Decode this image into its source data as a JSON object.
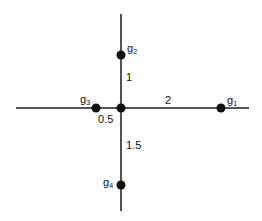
{
  "diagram": {
    "type": "star-graph",
    "center": {
      "x": 121,
      "y": 108
    },
    "edges": [
      {
        "id": "horizontal-axis",
        "x1": 16,
        "y1": 108,
        "x2": 249,
        "y2": 108
      },
      {
        "id": "vertical-axis",
        "x1": 121,
        "y1": 14,
        "x2": 121,
        "y2": 211
      }
    ],
    "nodes": [
      {
        "id": "center",
        "x": 121,
        "y": 108,
        "label": "",
        "sub": ""
      },
      {
        "id": "g1",
        "x": 221,
        "y": 108,
        "label": "g",
        "sub": "1",
        "lx": 227,
        "ly": 104
      },
      {
        "id": "g2",
        "x": 121,
        "y": 55,
        "label": "g",
        "sub": "2",
        "lx": 127,
        "ly": 52
      },
      {
        "id": "g3",
        "x": 96,
        "y": 108,
        "label": "g",
        "sub": "3",
        "lx": 80,
        "ly": 103
      },
      {
        "id": "g4",
        "x": 121,
        "y": 185,
        "label": "g",
        "sub": "4",
        "lx": 103,
        "ly": 186
      }
    ],
    "weights": [
      {
        "edge": "center-g2",
        "value": "1",
        "x": 126,
        "y": 81
      },
      {
        "edge": "center-g1",
        "value": "2",
        "x": 165,
        "y": 104
      },
      {
        "edge": "center-g3",
        "value": "0.5",
        "x": 98,
        "y": 123
      },
      {
        "edge": "center-g4",
        "value": "1.5",
        "x": 126,
        "y": 149
      }
    ],
    "colors": {
      "line": "#1a1a1a",
      "node": "#111111",
      "background": "#ffffff"
    }
  }
}
